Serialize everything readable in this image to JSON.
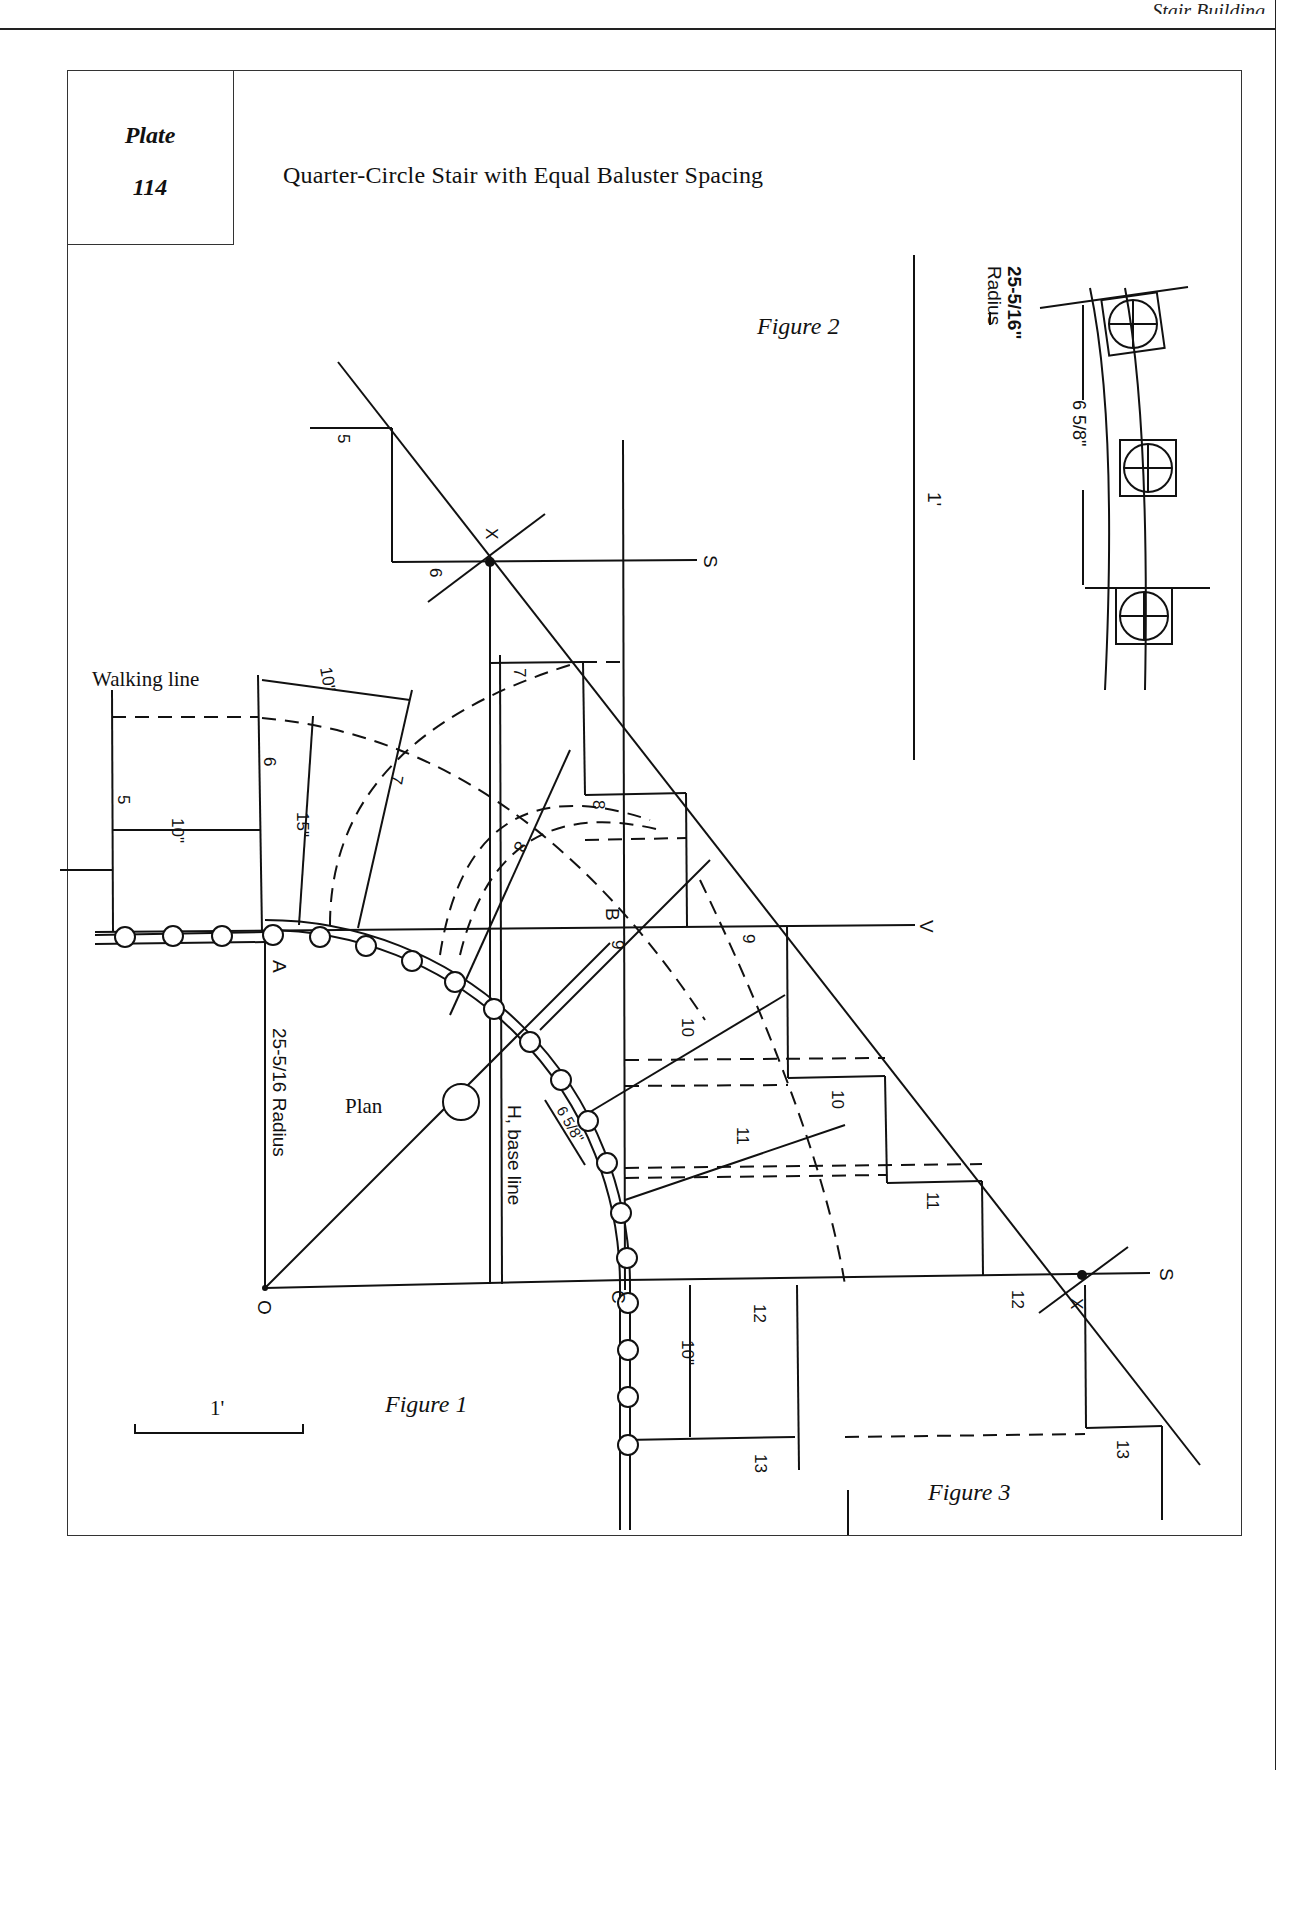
{
  "page": {
    "running_head": "Stair Building"
  },
  "plate": {
    "label": "Plate",
    "number": "114",
    "title": "Quarter-Circle Stair with Equal Baluster Spacing"
  },
  "figures": {
    "figure1": {
      "caption": "Figure 1",
      "plan_label": "Plan",
      "radius_label": "25-5/16 Radius",
      "base_line_label": "H, base line",
      "walking_line_label": "Walking line",
      "scale_bar_label": "1'",
      "points": {
        "A": "A",
        "B": "B",
        "C": "C",
        "O": "O",
        "V": "V",
        "S": "S",
        "X": "X"
      },
      "dimensions": {
        "walking_line_offset": "15\"",
        "tread_width_straight": "10\"",
        "tread_width_walking": "10\"",
        "tread_width_bottom": "10\"",
        "baluster_spacing": "6 5/8\""
      },
      "step_numbers": [
        "5",
        "6",
        "7",
        "8",
        "9",
        "10",
        "11",
        "12",
        "13"
      ]
    },
    "figure2": {
      "caption": "Figure 2",
      "radius_label_line1": "25-5/16\"",
      "radius_label_line2": "Radius",
      "baluster_spacing": "6 5/8\"",
      "scale_bar_label": "1'"
    },
    "figure3": {
      "caption": "Figure 3"
    }
  },
  "style": {
    "ink": "#111111",
    "paper": "#ffffff"
  }
}
